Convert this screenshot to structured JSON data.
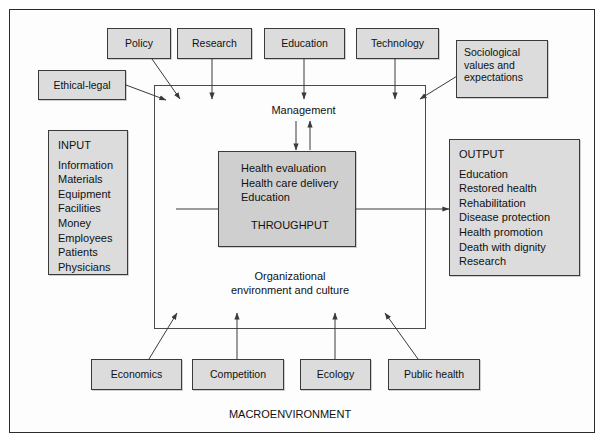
{
  "diagram": {
    "title_label": "MACROENVIRONMENT",
    "management_label": "Management",
    "org_env_label_line1": "Organizational",
    "org_env_label_line2": "environment and culture",
    "colors": {
      "node_fill": "#dcdcdc",
      "throughput_fill": "#cfcfcf",
      "line": "#3a3a3a",
      "frame": "#2b2b2b",
      "text": "#111111"
    },
    "top_nodes": [
      {
        "id": "policy",
        "label": "Policy"
      },
      {
        "id": "research",
        "label": "Research"
      },
      {
        "id": "education",
        "label": "Education"
      },
      {
        "id": "technology",
        "label": "Technology"
      }
    ],
    "ethical_legal": {
      "id": "ethical-legal",
      "label": "Ethical-legal"
    },
    "sociological": {
      "id": "sociological-values",
      "line1": "Sociological",
      "line2": "values and",
      "line3": "expectations"
    },
    "input_box": {
      "id": "input",
      "header": "INPUT",
      "items": [
        "Information",
        "Materials",
        "Equipment",
        "Facilities",
        "Money",
        "Employees",
        "Patients",
        "Physicians"
      ]
    },
    "throughput_box": {
      "id": "throughput",
      "items": [
        "Health evaluation",
        "Health care delivery",
        "Education"
      ],
      "label": "THROUGHPUT"
    },
    "output_box": {
      "id": "output",
      "header": "OUTPUT",
      "items": [
        "Education",
        "Restored health",
        "Rehabilitation",
        "Disease protection",
        "Health promotion",
        "Death with dignity",
        "Research"
      ]
    },
    "bottom_nodes": [
      {
        "id": "economics",
        "label": "Economics"
      },
      {
        "id": "competition",
        "label": "Competition"
      },
      {
        "id": "ecology",
        "label": "Ecology"
      },
      {
        "id": "public-health",
        "label": "Public health"
      }
    ]
  }
}
